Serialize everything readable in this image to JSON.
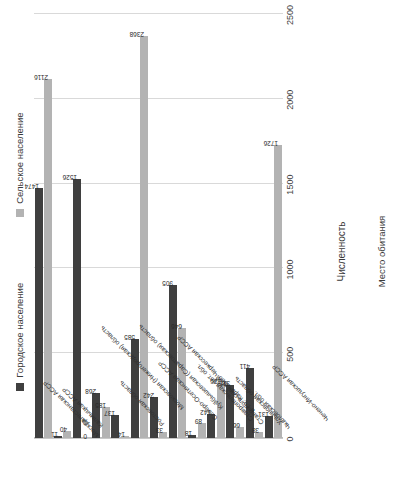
{
  "chart_data": {
    "type": "bar",
    "orientation": "horizontal",
    "title": "",
    "xlabel": "Численность",
    "ylabel": "Место обитания",
    "xlim": [
      0,
      2500
    ],
    "xticks": [
      0,
      500,
      1000,
      1500,
      2000,
      2500
    ],
    "grid": true,
    "legend_position": "top",
    "categories": [
      "Дагестанская АССР",
      "Калмыцкая АССР",
      "Москва",
      "Московская (Нижегородская) область",
      "Ростовская область",
      "Куйбышевская (Саратовская) область",
      "Северо-Осетинская АССР",
      "в т.ч. Карачаево-Черкесская АССР",
      "Ставропольская авт. обл.",
      "Ставропольский край",
      "Ульяновская область",
      "Чкаловская обл.",
      "Чечено-Ингушская АССР"
    ],
    "series": [
      {
        "name": "Городское население",
        "color": "#3f3f3f",
        "values": [
          1474,
          11,
          1526,
          268,
          137,
          585,
          242,
          905,
          18,
          142,
          315,
          411,
          131
        ]
      },
      {
        "name": "Сельское население",
        "color": "#b3b3b3",
        "values": [
          2116,
          40,
          0,
          185,
          14,
          2368,
          33,
          646,
          89,
          326,
          66,
          38,
          1726
        ]
      }
    ]
  },
  "legend": {
    "items": [
      {
        "label": "Городское население",
        "color": "#3f3f3f"
      },
      {
        "label": "Сельское население",
        "color": "#b3b3b3"
      }
    ]
  },
  "axis": {
    "value_title": "Численность",
    "category_title": "Место обитания",
    "ticks": [
      "0",
      "500",
      "1000",
      "1500",
      "2000",
      "2500"
    ]
  },
  "colors": {
    "urban": "#3f3f3f",
    "rural": "#b3b3b3",
    "grid": "#d9d9d9",
    "text": "#2f2f2f",
    "background": "#ffffff"
  }
}
